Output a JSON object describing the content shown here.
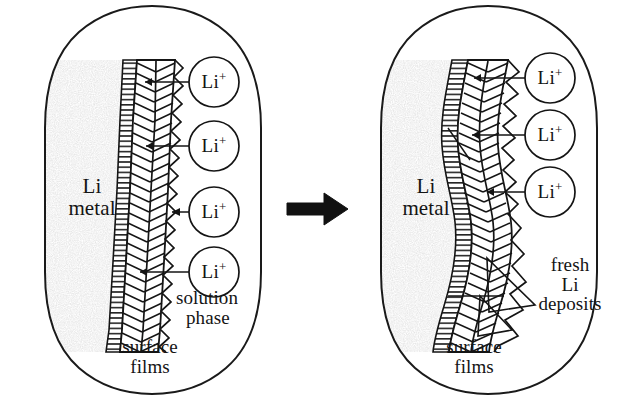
{
  "figure": {
    "type": "schematic-diagram",
    "background_color": "#ffffff",
    "ink_color": "#141414",
    "metal_fill_color": "#c9c9c9"
  },
  "transition_arrow": {
    "name": "process-arrow",
    "direction": "right",
    "color": "#111111"
  },
  "panels": [
    {
      "id": "before",
      "position": "left",
      "labels": {
        "metal_line1": "Li",
        "metal_line2": "metal",
        "solution_line1": "solution",
        "solution_line2": "phase",
        "films_line1": "surface",
        "films_line2": "films"
      },
      "ions": [
        {
          "label": "Li",
          "charge": "+",
          "cx": 214,
          "cy": 82,
          "r": 25
        },
        {
          "label": "Li",
          "charge": "+",
          "cx": 214,
          "cy": 146,
          "r": 25
        },
        {
          "label": "Li",
          "charge": "+",
          "cx": 214,
          "cy": 212,
          "r": 25
        },
        {
          "label": "Li",
          "charge": "+",
          "cx": 214,
          "cy": 272,
          "r": 25
        }
      ]
    },
    {
      "id": "after",
      "position": "right",
      "labels": {
        "metal_line1": "Li",
        "metal_line2": "metal",
        "deposits_line1": "fresh",
        "deposits_line2": "Li",
        "deposits_line3": "deposits",
        "films_line1": "surface",
        "films_line2": "films"
      },
      "ions": [
        {
          "label": "Li",
          "charge": "+",
          "cx": 550,
          "cy": 78,
          "r": 25
        },
        {
          "label": "Li",
          "charge": "+",
          "cx": 550,
          "cy": 135,
          "r": 25
        },
        {
          "label": "Li",
          "charge": "+",
          "cx": 550,
          "cy": 192,
          "r": 25
        }
      ]
    }
  ]
}
